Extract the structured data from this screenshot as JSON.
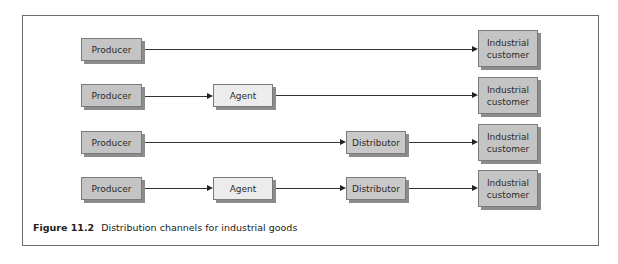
{
  "figure": {
    "label": "Figure 11.2",
    "caption": "Distribution channels for industrial goods"
  },
  "rows": [
    {
      "nodes": [
        "Producer",
        "Industrial customer"
      ]
    },
    {
      "nodes": [
        "Producer",
        "Agent",
        "Industrial customer"
      ]
    },
    {
      "nodes": [
        "Producer",
        "Distributor",
        "Industrial customer"
      ]
    },
    {
      "nodes": [
        "Producer",
        "Agent",
        "Distributor",
        "Industrial customer"
      ]
    }
  ],
  "labels": {
    "producer": "Producer",
    "agent": "Agent",
    "distributor": "Distributor",
    "customer_line1": "Industrial",
    "customer_line2": "customer"
  },
  "colors": {
    "producer_fill": "#c4c4c4",
    "agent_fill": "#ececec",
    "distributor_fill": "#c9c9c9",
    "customer_fill": "#c4c4c4",
    "line": "#333333"
  }
}
